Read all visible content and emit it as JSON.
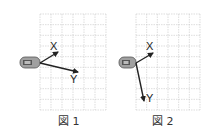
{
  "figures": [
    {
      "caption": "図 1",
      "grid": {
        "x": 40,
        "y": 14,
        "w": 66,
        "h": 96,
        "cols": 6,
        "rows": 9
      },
      "device": {
        "x": 20,
        "y": 57,
        "w": 20,
        "h": 11
      },
      "origin": [
        40,
        63
      ],
      "axes": [
        {
          "label": "X",
          "tip": [
            58,
            52
          ],
          "label_pos": [
            50,
            50
          ]
        },
        {
          "label": "Y",
          "tip": [
            78,
            72
          ],
          "label_pos": [
            70,
            83
          ]
        }
      ]
    },
    {
      "caption": "図 2",
      "grid": {
        "x": 136,
        "y": 14,
        "w": 64,
        "h": 96,
        "cols": 6,
        "rows": 9
      },
      "device": {
        "x": 119,
        "y": 57,
        "w": 17,
        "h": 11
      },
      "origin": [
        136,
        63
      ],
      "axes": [
        {
          "label": "X",
          "tip": [
            153,
            53
          ],
          "label_pos": [
            146,
            50
          ]
        },
        {
          "label": "Y",
          "tip": [
            144,
            101
          ],
          "label_pos": [
            146,
            102
          ]
        }
      ]
    }
  ],
  "colors": {
    "grid": "#c8c8c8",
    "arrow": "#222222",
    "device_body": "#9a9a9a",
    "device_screen": "#555555"
  }
}
